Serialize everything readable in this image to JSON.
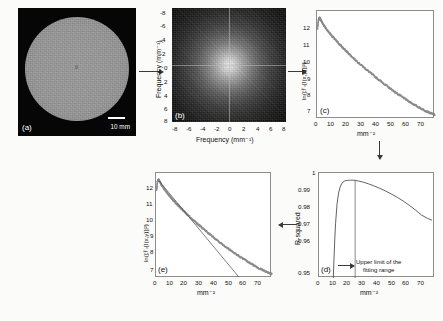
{
  "figure": {
    "panels": [
      "a",
      "b",
      "c",
      "d",
      "e"
    ]
  },
  "panel_a": {
    "tag": "(a)",
    "scalebar_label": "10 mm",
    "description": "uniform circular phantom MR image"
  },
  "panel_b": {
    "tag": "(b)",
    "xlabel": "Frequency (mm⁻¹)",
    "ylabel": "Frequency (mm⁻¹)",
    "xticks": [
      "-8",
      "-6",
      "-4",
      "-2",
      "0",
      "2",
      "4",
      "6",
      "8"
    ],
    "yticks": [
      "-8",
      "-6",
      "-4",
      "-2",
      "0",
      "2",
      "4",
      "6",
      "8"
    ]
  },
  "panel_c": {
    "tag": "(c)",
    "xlabel": "mm⁻²",
    "ylabel": "ln(|ℱᵣ[I(x,y)]|²)",
    "xticks": [
      "0",
      "10",
      "20",
      "30",
      "40",
      "50",
      "60",
      "70"
    ],
    "yticks": [
      "7",
      "8",
      "9",
      "10",
      "11",
      "12"
    ]
  },
  "panel_d": {
    "tag": "(d)",
    "xlabel": "mm⁻²",
    "ylabel": "R-squared",
    "xticks": [
      "0",
      "10",
      "20",
      "30",
      "40",
      "50",
      "60",
      "70"
    ],
    "yticks": [
      "0.95",
      "0.96",
      "0.97",
      "0.98",
      "0.99",
      "1"
    ],
    "annotation": "Upper limit of the\nfitting range",
    "annotation_line1": "Upper limit of the",
    "annotation_line2": "fitting range"
  },
  "panel_e": {
    "tag": "(e)",
    "xlabel": "mm⁻²",
    "ylabel": "ln(|ℱᵣ[I(x,y)]|²)",
    "xticks": [
      "0",
      "10",
      "20",
      "30",
      "40",
      "50",
      "60",
      "70"
    ],
    "yticks": [
      "7",
      "8",
      "9",
      "10",
      "11",
      "12"
    ]
  },
  "chart_data": [
    {
      "id": "panel_c",
      "type": "scatter",
      "title": "",
      "xlabel": "mm⁻²",
      "ylabel": "ln(|ℱᵣ[I(x,y)]|²)",
      "xlim": [
        0,
        77
      ],
      "ylim": [
        6.7,
        12.4
      ],
      "grid": false,
      "legend": "none",
      "series": [
        {
          "name": "radially averaged log power spectrum",
          "color": "#8a8a8a",
          "x": [
            0.3,
            1.0,
            1.8,
            2.6,
            3.5,
            5.0,
            7.0,
            9.0,
            11.0,
            13.0,
            15.0,
            17.0,
            19.0,
            21.0,
            24.0,
            27.0,
            30.0,
            33.0,
            36.0,
            39.0,
            42.0,
            45.0,
            48.0,
            51.0,
            54.0,
            57.0,
            60.0,
            63.0,
            66.0,
            69.0,
            72.0,
            75.0,
            77.0
          ],
          "y": [
            11.45,
            11.95,
            12.05,
            11.92,
            11.78,
            11.58,
            11.36,
            11.16,
            10.97,
            10.79,
            10.62,
            10.45,
            10.29,
            10.13,
            9.9,
            9.68,
            9.47,
            9.26,
            9.06,
            8.86,
            8.67,
            8.48,
            8.3,
            8.12,
            7.95,
            7.79,
            7.63,
            7.48,
            7.34,
            7.21,
            7.09,
            6.98,
            6.92
          ]
        }
      ]
    },
    {
      "id": "panel_d",
      "type": "line",
      "title": "",
      "xlabel": "mm⁻²",
      "ylabel": "R-squared",
      "xlim": [
        0,
        77
      ],
      "ylim": [
        0.95,
        1.0
      ],
      "grid": false,
      "legend": "none",
      "annotations": [
        {
          "text": "Upper limit of the fitting range",
          "x": 24,
          "type": "vertical-line-with-arrow"
        }
      ],
      "series": [
        {
          "name": "R-squared of linear fit vs upper fitting limit",
          "color": "#3a3a3a",
          "x": [
            9.5,
            10.0,
            10.5,
            11.0,
            12.0,
            13.0,
            14.0,
            15.0,
            16.0,
            17.0,
            18.0,
            19.0,
            20.0,
            21.0,
            22.0,
            23.0,
            24.0,
            26.0,
            28.0,
            30.0,
            33.0,
            36.0,
            40.0,
            44.0,
            48.0,
            52.0,
            56.0,
            60.0,
            64.0,
            68.0,
            72.0,
            75.0
          ],
          "y": [
            0.95,
            0.96,
            0.969,
            0.976,
            0.9855,
            0.9905,
            0.9932,
            0.9948,
            0.9957,
            0.9962,
            0.9964,
            0.9965,
            0.99655,
            0.99658,
            0.9966,
            0.99655,
            0.9965,
            0.9962,
            0.9959,
            0.9955,
            0.9948,
            0.994,
            0.9928,
            0.9915,
            0.99,
            0.9884,
            0.9866,
            0.9846,
            0.9824,
            0.98,
            0.9784,
            0.9775
          ]
        }
      ]
    },
    {
      "id": "panel_e",
      "type": "scatter",
      "title": "",
      "xlabel": "mm⁻²",
      "ylabel": "ln(|ℱᵣ[I(x,y)]|²)",
      "xlim": [
        0,
        77
      ],
      "ylim": [
        6.7,
        12.4
      ],
      "grid": false,
      "legend": "none",
      "series": [
        {
          "name": "radially averaged log power spectrum",
          "color": "#8a8a8a",
          "x": [
            0.3,
            1.0,
            1.8,
            2.6,
            3.5,
            5.0,
            7.0,
            9.0,
            11.0,
            13.0,
            15.0,
            17.0,
            19.0,
            21.0,
            24.0,
            27.0,
            30.0,
            33.0,
            36.0,
            39.0,
            42.0,
            45.0,
            48.0,
            51.0,
            54.0,
            57.0,
            60.0,
            63.0,
            66.0,
            69.0,
            72.0,
            75.0,
            77.0
          ],
          "y": [
            11.45,
            11.95,
            12.05,
            11.92,
            11.78,
            11.58,
            11.36,
            11.16,
            10.97,
            10.79,
            10.62,
            10.45,
            10.29,
            10.13,
            9.9,
            9.68,
            9.47,
            9.26,
            9.06,
            8.86,
            8.67,
            8.48,
            8.3,
            8.12,
            7.95,
            7.79,
            7.63,
            7.48,
            7.34,
            7.21,
            7.09,
            6.98,
            6.92
          ]
        },
        {
          "name": "linear fit over the selected range",
          "color": "#4a4a4a",
          "x": [
            2.0,
            55.0
          ],
          "y": [
            11.98,
            6.75
          ]
        }
      ]
    }
  ]
}
